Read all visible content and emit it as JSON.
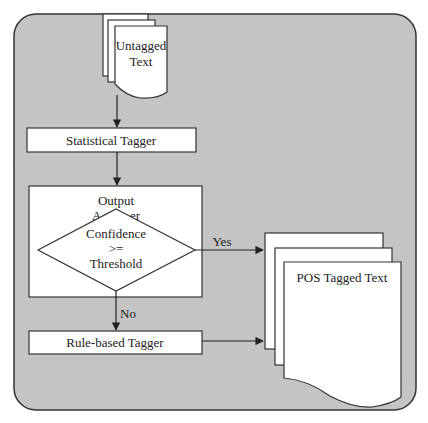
{
  "diagram": {
    "colors": {
      "background": "#ffffff",
      "panel_fill": "#c4c4c4",
      "stroke": "#333333",
      "box_fill": "#ffffff"
    },
    "nodes": {
      "input_doc": {
        "line1": "Untagged",
        "line2": "Text"
      },
      "statistical_tagger": {
        "label": "Statistical Tagger"
      },
      "output_analyzer": {
        "label_visible": "Output",
        "label_obscured": "A         er"
      },
      "decision": {
        "line1": "Confidence",
        "line2": ">=",
        "line3": "Threshold"
      },
      "rule_based_tagger": {
        "label": "Rule-based Tagger"
      },
      "output_doc": {
        "label": "POS Tagged Text"
      }
    },
    "edges": {
      "yes_label": "Yes",
      "no_label": "No"
    }
  }
}
